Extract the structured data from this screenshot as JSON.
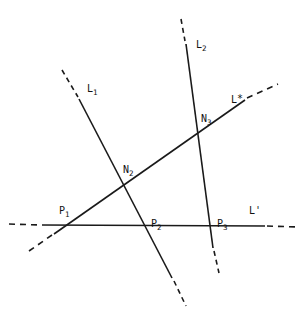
{
  "figure": {
    "kind": "geometric-line-diagram",
    "width": 307,
    "height": 320,
    "background_color": "#ffffff",
    "stroke_color": "#1a1a1a",
    "label_color": "#111111"
  },
  "labels": {
    "l1": "L",
    "l1_sub": "1",
    "l2": "L",
    "l2_sub": "2",
    "lstar": "L",
    "lstar_sup": "*",
    "lprime": "L'",
    "n2": "N",
    "n2_sub": "2",
    "n3": "N",
    "n3_sub": "3",
    "p1": "P",
    "p1_sub": "1",
    "p2": "P",
    "p2_sub": "2",
    "p3": "P",
    "p3_sub": "3"
  },
  "label_positions": {
    "l1": {
      "x": 87,
      "y": 84
    },
    "l2": {
      "x": 196,
      "y": 40
    },
    "lstar": {
      "x": 231,
      "y": 95
    },
    "lprime": {
      "x": 249,
      "y": 206
    },
    "n2": {
      "x": 123,
      "y": 165
    },
    "n3": {
      "x": 201,
      "y": 114
    },
    "p1": {
      "x": 59,
      "y": 206
    },
    "p2": {
      "x": 151,
      "y": 219
    },
    "p3": {
      "x": 217,
      "y": 219
    }
  },
  "geometry": {
    "lines": [
      {
        "name": "L1",
        "solid": {
          "x1": 79,
          "y1": 99,
          "x2": 172,
          "y2": 278
        },
        "dash_start": {
          "x1": 62,
          "y1": 70,
          "x2": 78,
          "y2": 97
        },
        "dash_end": {
          "x1": 174,
          "y1": 281,
          "x2": 186,
          "y2": 306
        }
      },
      {
        "name": "L2",
        "solid": {
          "x1": 186,
          "y1": 44,
          "x2": 213,
          "y2": 248
        },
        "dash_start": {
          "x1": 181,
          "y1": 19,
          "x2": 185,
          "y2": 41
        },
        "dash_end": {
          "x1": 214,
          "y1": 251,
          "x2": 219,
          "y2": 273
        }
      },
      {
        "name": "Lstar",
        "solid": {
          "x1": 54,
          "y1": 234,
          "x2": 245,
          "y2": 100
        },
        "dash_start": {
          "x1": 29,
          "y1": 251,
          "x2": 52,
          "y2": 235
        },
        "dash_end": {
          "x1": 247,
          "y1": 98,
          "x2": 278,
          "y2": 84
        }
      },
      {
        "name": "Lprime",
        "solid": {
          "x1": 42,
          "y1": 225,
          "x2": 265,
          "y2": 226
        },
        "dash_start": {
          "x1": 9,
          "y1": 224,
          "x2": 40,
          "y2": 225
        },
        "dash_end": {
          "x1": 267,
          "y1": 226,
          "x2": 298,
          "y2": 227
        }
      }
    ],
    "points": [
      {
        "name": "P1",
        "x": 70,
        "y": 224,
        "on": [
          "Lstar",
          "Lprime"
        ]
      },
      {
        "name": "P2",
        "x": 147,
        "y": 225,
        "on": [
          "L1",
          "Lprime"
        ]
      },
      {
        "name": "P3",
        "x": 212,
        "y": 226,
        "on": [
          "L2",
          "Lprime"
        ]
      },
      {
        "name": "N2",
        "x": 128,
        "y": 185,
        "on": [
          "L1",
          "Lstar"
        ]
      },
      {
        "name": "N3",
        "x": 198,
        "y": 138,
        "on": [
          "L2",
          "Lstar"
        ]
      }
    ]
  }
}
